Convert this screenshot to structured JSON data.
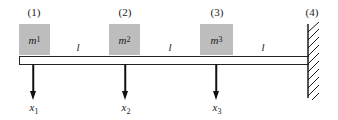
{
  "diagram": {
    "type": "cantilever beam with three lumped masses",
    "nodes": [
      {
        "label": "(1)",
        "x": 34
      },
      {
        "label": "(2)",
        "x": 125
      },
      {
        "label": "(3)",
        "x": 217
      },
      {
        "label": "(4)",
        "x": 312
      }
    ],
    "masses": [
      {
        "symbol": "m",
        "sub": "1",
        "left": 19,
        "width": 31
      },
      {
        "symbol": "m",
        "sub": "2",
        "left": 109,
        "width": 31
      },
      {
        "symbol": "m",
        "sub": "3",
        "left": 200,
        "width": 33
      }
    ],
    "spans": [
      {
        "label": "l",
        "x": 78
      },
      {
        "label": "l",
        "x": 170
      },
      {
        "label": "l",
        "x": 263
      }
    ],
    "displacements": [
      {
        "symbol": "x",
        "sub": "1",
        "x": 33
      },
      {
        "symbol": "x",
        "sub": "2",
        "x": 125
      },
      {
        "symbol": "x",
        "sub": "3",
        "x": 216
      }
    ],
    "support": {
      "type": "fixed wall",
      "node": "(4)"
    },
    "colors": {
      "mass_fill": "#bdbdbd",
      "line": "#1a1a1a"
    }
  }
}
